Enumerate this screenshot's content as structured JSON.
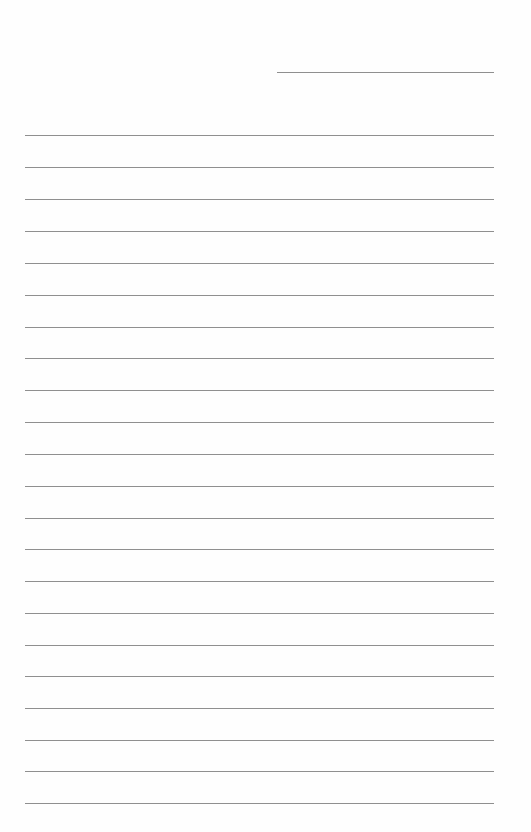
{
  "document": {
    "type": "lined-paper",
    "background_color": "#fefefe",
    "line_color": "#8f8f8f",
    "header_line": {
      "x": 277,
      "y": 72,
      "width": 217
    },
    "rules": {
      "count": 22,
      "x": 25,
      "width": 469,
      "positions_y": [
        135,
        167,
        199,
        231,
        263,
        295,
        327,
        358,
        390,
        422,
        454,
        486,
        518,
        549,
        581,
        613,
        645,
        676,
        708,
        740,
        771,
        803
      ]
    }
  }
}
